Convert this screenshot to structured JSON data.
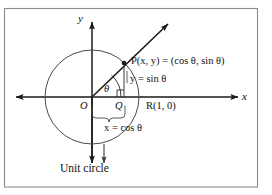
{
  "figure": {
    "caption": "Unit circle",
    "axes": {
      "y_label": "y",
      "x_label": "x",
      "origin_label": "O"
    },
    "points": {
      "P": "P(x, y) = (cos θ, sin θ)",
      "Q": "Q",
      "R": "R(1, 0)"
    },
    "annotations": {
      "vertical_leg": "y = sin θ",
      "horizontal_leg": "x = cos θ",
      "angle": "θ"
    },
    "colors": {
      "ink": "#111111",
      "stroke": "#222222",
      "thin_stroke": "#555555",
      "frame": "#888888",
      "background": "#ffffff"
    },
    "geometry": {
      "origin_x": 92,
      "origin_y": 97,
      "radius": 47,
      "point_p_x": 124,
      "point_p_y": 63,
      "ray_tip_x": 170,
      "ray_tip_y": 22,
      "angle_degrees": 47
    }
  }
}
